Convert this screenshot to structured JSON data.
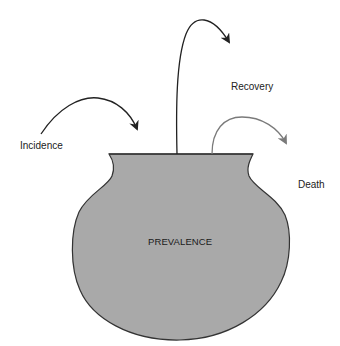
{
  "diagram": {
    "type": "pot-flow-metaphor",
    "container": {
      "label": "PREVALENCE",
      "shape": "pot",
      "fill_color": "#a9a9a9",
      "stroke_color": "#333333"
    },
    "flows": [
      {
        "label": "Incidence",
        "direction": "into",
        "arrow_color": "#222222"
      },
      {
        "label": "Recovery",
        "direction": "out-of",
        "arrow_color": "#222222"
      },
      {
        "label": "Death",
        "direction": "out-of",
        "arrow_color": "#7a7a7a"
      }
    ]
  }
}
